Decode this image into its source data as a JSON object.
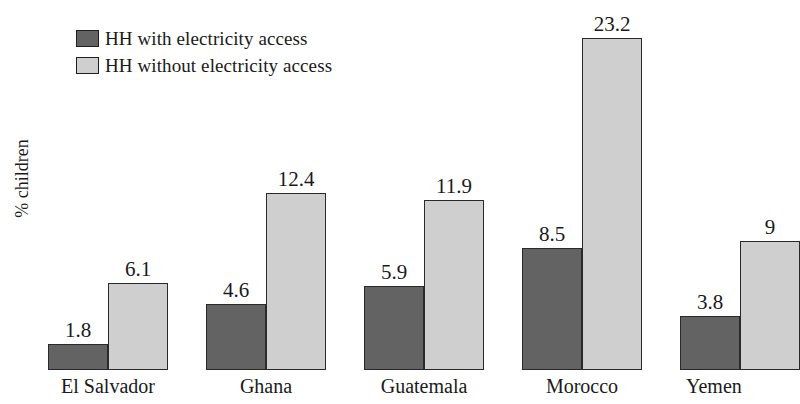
{
  "chart_data": {
    "type": "bar",
    "title": "",
    "subtitle": "",
    "xlabel": "",
    "ylabel": "% children",
    "categories": [
      "El Salvador",
      "Ghana",
      "Guatemala",
      "Morocco",
      "Yemen"
    ],
    "series": [
      {
        "name": "HH with electricity access",
        "color": "#636363",
        "values": [
          1.8,
          4.6,
          5.9,
          8.5,
          3.8
        ],
        "value_labels": [
          "1.8",
          "4.6",
          "5.9",
          "8.5",
          "3.8"
        ]
      },
      {
        "name": "HH without electricity access",
        "color": "#cfcfcf",
        "values": [
          6.1,
          12.4,
          11.9,
          23.2,
          9
        ],
        "value_labels": [
          "6.1",
          "12.4",
          "11.9",
          "23.2",
          "9"
        ]
      }
    ],
    "ylim": [
      0,
      23.2
    ],
    "grid": false,
    "legend_position": "top-left",
    "axis_ticks_visible": false
  },
  "legend": {
    "items": [
      {
        "label": "HH with electricity access",
        "swatch": "dark-gray-swatch",
        "color": "#636363"
      },
      {
        "label": "HH without electricity access",
        "swatch": "light-gray-swatch",
        "color": "#cfcfcf"
      }
    ]
  },
  "axis": {
    "y_title": "% children"
  }
}
